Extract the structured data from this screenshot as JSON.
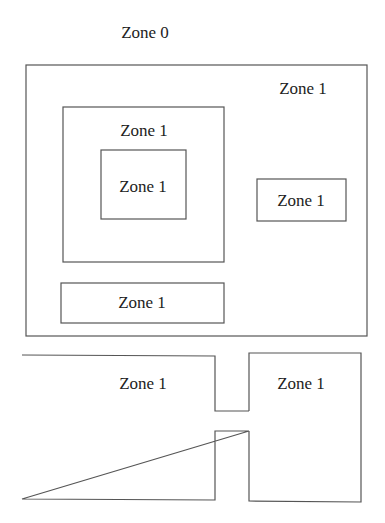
{
  "diagram": {
    "title_label": "Zone 0",
    "outer_region": {
      "label": "Zone 1",
      "inner_square": {
        "label": "Zone 1",
        "nested_square": {
          "label": "Zone 1"
        }
      },
      "right_box": {
        "label": "Zone 1"
      },
      "bottom_box": {
        "label": "Zone 1"
      }
    },
    "connected_regions": {
      "left_room": {
        "label": "Zone 1"
      },
      "right_room": {
        "label": "Zone 1"
      }
    },
    "colors": {
      "stroke": "#555555",
      "text": "#222222",
      "background": "#ffffff"
    }
  }
}
